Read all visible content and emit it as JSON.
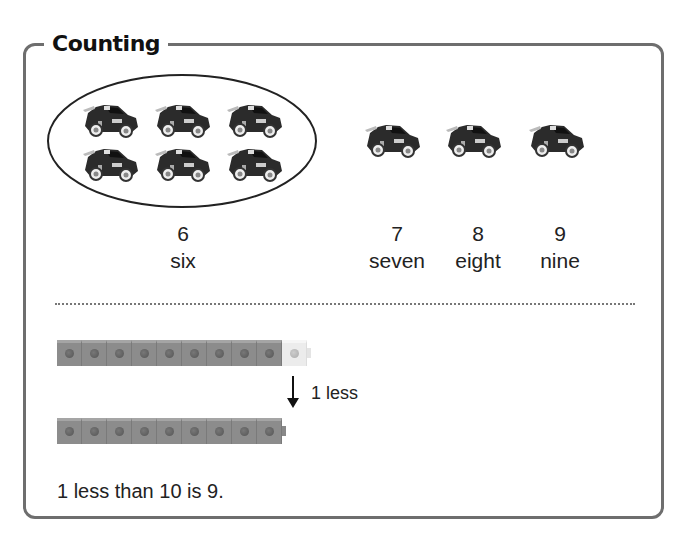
{
  "section": {
    "title": "Counting"
  },
  "group": {
    "count": 6,
    "number": "6",
    "word": "six",
    "item_icon": "toy-race-car-icon"
  },
  "counting_items": [
    {
      "number": "7",
      "word": "seven"
    },
    {
      "number": "8",
      "word": "eight"
    },
    {
      "number": "9",
      "word": "nine"
    }
  ],
  "cubes": {
    "top_row": {
      "grey_count": 9,
      "white_count": 1,
      "total": 10
    },
    "bottom_row": {
      "grey_count": 9,
      "total": 9
    },
    "arrow_label": "1 less",
    "colors": {
      "grey": "#8c8c8c",
      "white": "#ececec"
    }
  },
  "statement": "1 less than 10 is 9."
}
